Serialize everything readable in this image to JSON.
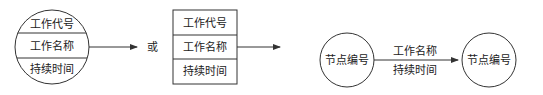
{
  "diagram": {
    "node_circle": {
      "rows": [
        "工作代号",
        "工作名称",
        "持续时间"
      ]
    },
    "connector_word": "或",
    "node_box": {
      "rows": [
        "工作代号",
        "工作名称",
        "持续时间"
      ]
    },
    "arrow_diagram": {
      "start_node": "节点编号",
      "end_node": "节点编号",
      "arrow_label_top": "工作名称",
      "arrow_label_bottom": "持续时间"
    }
  },
  "colors": {
    "stroke": "#333333",
    "text": "#222222",
    "background": "#ffffff"
  }
}
